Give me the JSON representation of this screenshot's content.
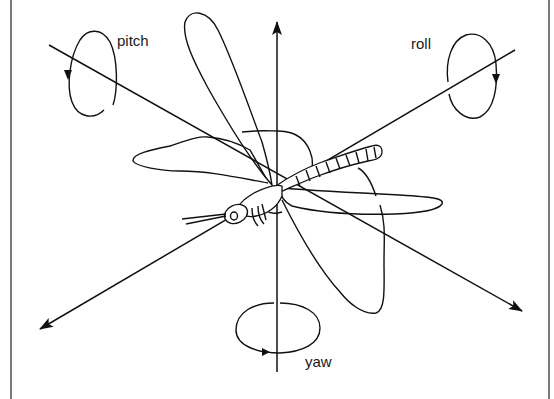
{
  "diagram": {
    "labels": {
      "pitch": "pitch",
      "roll": "roll",
      "yaw": "yaw"
    },
    "axes": [
      {
        "name": "yaw-axis",
        "direction": "vertical",
        "arrow": "top"
      },
      {
        "name": "pitch-axis",
        "direction": "diagonal top-left to bottom-right",
        "arrow": "bottom-right"
      },
      {
        "name": "roll-axis",
        "direction": "diagonal top-right to bottom-left",
        "arrow": "bottom-left"
      }
    ],
    "rotation_loops": [
      {
        "name": "pitch-loop",
        "orientation": "vertical ellipse",
        "arrow": "downward on left side"
      },
      {
        "name": "roll-loop",
        "orientation": "vertical ellipse",
        "arrow": "downward on right side"
      },
      {
        "name": "yaw-loop",
        "orientation": "horizontal ellipse",
        "arrow": "rightward at bottom"
      }
    ],
    "colors": {
      "line": "#111111",
      "background": "#ffffff",
      "frame": "#7a7a7a"
    }
  }
}
